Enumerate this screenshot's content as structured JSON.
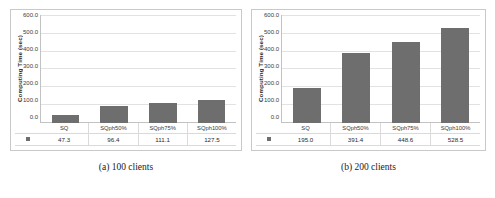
{
  "figure": {
    "panels": [
      {
        "caption": "(a) 100 clients",
        "legend_marker": "square-marker",
        "chart_data": {
          "type": "bar",
          "title": "",
          "xlabel": "",
          "ylabel": "Computing Time (sec)",
          "categories": [
            "SQ",
            "SQph50%",
            "SQph75%",
            "SQph100%"
          ],
          "values": [
            47.3,
            96.4,
            111.1,
            127.5
          ],
          "value_labels": [
            "47.3",
            "96.4",
            "111.1",
            "127.5"
          ],
          "ylim": [
            0.0,
            600.0
          ],
          "yticks": [
            600.0,
            500.0,
            400.0,
            300.0,
            200.0,
            100.0,
            0.0
          ],
          "ytick_labels": [
            "600.0",
            "500.0",
            "400.0",
            "300.0",
            "200.0",
            "100.0",
            "0.0"
          ],
          "grid": true,
          "legend_position": "none",
          "bar_color": "#6e6e6e",
          "series_name": ""
        }
      },
      {
        "caption": "(b) 200 clients",
        "legend_marker": "square-marker",
        "chart_data": {
          "type": "bar",
          "title": "",
          "xlabel": "",
          "ylabel": "Computing Time (sec)",
          "categories": [
            "SQ",
            "SQph50%",
            "SQph75%",
            "SQph100%"
          ],
          "values": [
            195.0,
            391.4,
            448.6,
            528.5
          ],
          "value_labels": [
            "195.0",
            "391.4",
            "448.6",
            "528.5"
          ],
          "ylim": [
            0.0,
            600.0
          ],
          "yticks": [
            600.0,
            500.0,
            400.0,
            300.0,
            200.0,
            100.0,
            0.0
          ],
          "ytick_labels": [
            "600.0",
            "500.0",
            "400.0",
            "300.0",
            "200.0",
            "100.0",
            "0.0"
          ],
          "grid": true,
          "legend_position": "none",
          "bar_color": "#6e6e6e",
          "series_name": ""
        }
      }
    ]
  }
}
